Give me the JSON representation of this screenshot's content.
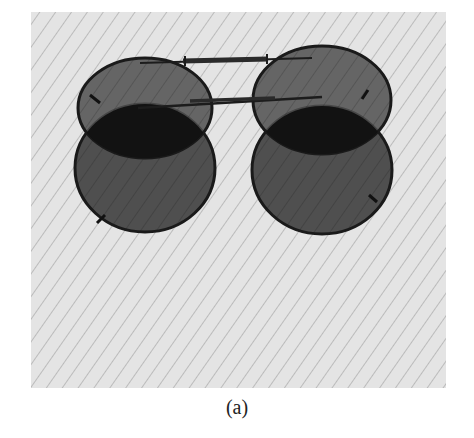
{
  "figure": {
    "caption": "(a)",
    "colors": {
      "paper": "#e4e4e4",
      "stripes": "#a9a9a9",
      "lens": "#4f4f4f",
      "lens_overlap": "#121212",
      "frame": "#1a1a1a"
    }
  }
}
